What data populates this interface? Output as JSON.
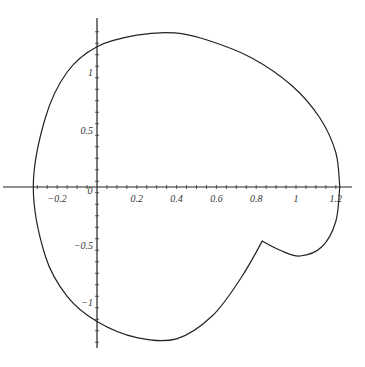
{
  "chart_data": {
    "type": "line",
    "title": "",
    "xlabel": "",
    "ylabel": "",
    "xlim": [
      -0.32,
      1.24
    ],
    "ylim": [
      -1.35,
      1.4
    ],
    "grid": false,
    "legend": null,
    "x_ticks": [
      "-0.2",
      "0",
      "0.2",
      "0.4",
      "0.6",
      "0.8",
      "1",
      "1.2"
    ],
    "y_ticks": [
      "1",
      "0.5",
      "-0.5",
      "-1"
    ],
    "series": [
      {
        "name": "closed curve",
        "points": [
          [
            1.22,
            0.0
          ],
          [
            1.2,
            0.3
          ],
          [
            1.12,
            0.6
          ],
          [
            0.98,
            0.88
          ],
          [
            0.78,
            1.12
          ],
          [
            0.55,
            1.28
          ],
          [
            0.39,
            1.34
          ],
          [
            0.2,
            1.32
          ],
          [
            0.0,
            1.22
          ],
          [
            -0.15,
            1.0
          ],
          [
            -0.26,
            0.6
          ],
          [
            -0.32,
            0.0
          ],
          [
            -0.26,
            -0.6
          ],
          [
            -0.15,
            -0.95
          ],
          [
            0.0,
            -1.17
          ],
          [
            0.2,
            -1.31
          ],
          [
            0.4,
            -1.32
          ],
          [
            0.58,
            -1.12
          ],
          [
            0.72,
            -0.8
          ],
          [
            0.83,
            -0.47
          ],
          [
            0.92,
            -0.55
          ],
          [
            1.02,
            -0.6
          ],
          [
            1.13,
            -0.52
          ],
          [
            1.2,
            -0.3
          ],
          [
            1.22,
            0.0
          ]
        ]
      }
    ],
    "annotations": [
      "cusp near (0.83, -0.47)"
    ]
  }
}
